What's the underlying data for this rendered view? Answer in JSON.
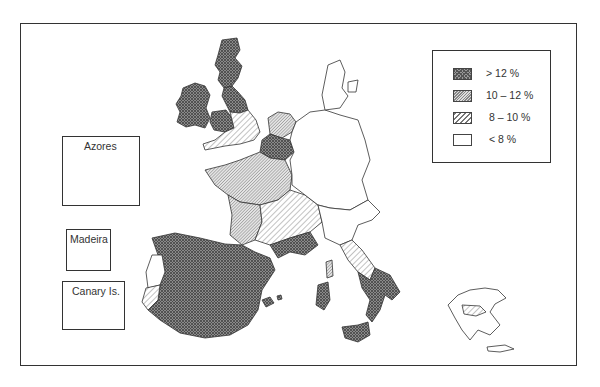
{
  "map": {
    "title": "",
    "subject": "Regional unemployment rates, European Community",
    "legend": {
      "items": [
        {
          "key": "high",
          "label": "> 12 %",
          "pattern": "dense-crosshatch",
          "color": "#7a7a7a"
        },
        {
          "key": "mid",
          "label": "10 – 12 %",
          "pattern": "fine-diagonal",
          "color": "#bdbdbd"
        },
        {
          "key": "low",
          "label": "8 – 10 %",
          "pattern": "wide-diagonal",
          "color": "#e2e2e2"
        },
        {
          "key": "none",
          "label": "< 8 %",
          "pattern": "blank",
          "color": "#ffffff"
        }
      ]
    },
    "insets": [
      {
        "name": "azores",
        "label": "Azores"
      },
      {
        "name": "madeira",
        "label": "Madeira"
      },
      {
        "name": "canary-islands",
        "label": "Canary Is."
      }
    ],
    "regions": [
      {
        "name": "Ireland",
        "class": "> 12 %"
      },
      {
        "name": "Scotland",
        "class": "> 12 %"
      },
      {
        "name": "Northern England",
        "class": "> 12 %"
      },
      {
        "name": "Wales",
        "class": "> 12 %"
      },
      {
        "name": "Southern England",
        "class": "8 – 10 %"
      },
      {
        "name": "Belgium / N. France",
        "class": "> 12 %"
      },
      {
        "name": "Netherlands",
        "class": "10 – 12 %"
      },
      {
        "name": "France (west/central)",
        "class": "10 – 12 %"
      },
      {
        "name": "France (south-east)",
        "class": "8 – 10 %"
      },
      {
        "name": "Mediterranean France",
        "class": "> 12 %"
      },
      {
        "name": "Spain",
        "class": "> 12 %"
      },
      {
        "name": "Portugal (north)",
        "class": "< 8 %"
      },
      {
        "name": "Portugal (south)",
        "class": "8 – 10 %"
      },
      {
        "name": "Germany",
        "class": "< 8 %"
      },
      {
        "name": "Denmark",
        "class": "< 8 %"
      },
      {
        "name": "Northern Italy",
        "class": "< 8 %"
      },
      {
        "name": "Central Italy",
        "class": "8 – 10 %"
      },
      {
        "name": "Southern Italy",
        "class": "> 12 %"
      },
      {
        "name": "Sicily",
        "class": "> 12 %"
      },
      {
        "name": "Sardinia",
        "class": "> 12 %"
      },
      {
        "name": "Corsica",
        "class": "10 – 12 %"
      },
      {
        "name": "Greece",
        "class": "< 8 %"
      },
      {
        "name": "Athens area",
        "class": "8 – 10 %"
      }
    ]
  }
}
